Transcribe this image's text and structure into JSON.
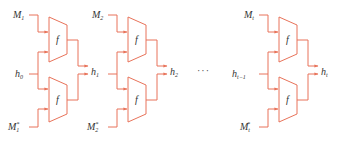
{
  "diagram": {
    "stroke_color": "#e8735a",
    "fill_color": "#ffffff",
    "text_color": "#333333",
    "function_label": "f",
    "ellipsis": "···",
    "blocks": [
      {
        "x": 0,
        "input_top": {
          "base": "M",
          "sub": "1",
          "sup": ""
        },
        "input_bottom": {
          "base": "M",
          "sub": "1",
          "sup": "*"
        },
        "hidden_in": {
          "base": "h",
          "sub": "0"
        },
        "hidden_out": {
          "base": "h",
          "sub": "1"
        }
      },
      {
        "x": 79,
        "input_top": {
          "base": "M",
          "sub": "2",
          "sup": ""
        },
        "input_bottom": {
          "base": "M",
          "sub": "2",
          "sup": "*"
        },
        "hidden_in": {
          "base": "h",
          "sub": "1"
        },
        "hidden_out": {
          "base": "h",
          "sub": "2"
        }
      },
      {
        "x": 230,
        "input_top": {
          "base": "M",
          "sub": "t",
          "sup": ""
        },
        "input_bottom": {
          "base": "M",
          "sub": "t",
          "sup": "*"
        },
        "hidden_in": {
          "base": "h",
          "sub": "t−1"
        },
        "hidden_out": {
          "base": "h",
          "sub": "t"
        }
      }
    ]
  }
}
